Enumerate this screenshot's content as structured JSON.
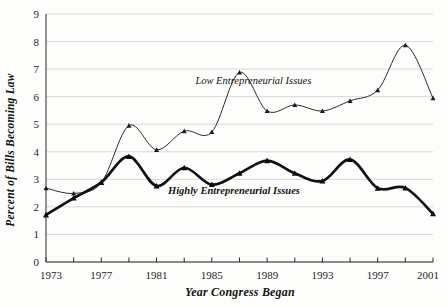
{
  "chart_data": {
    "type": "line",
    "title": "",
    "xlabel": "Year Congress Began",
    "ylabel": "Percent of Bills Becoming Law",
    "xlim": [
      1973,
      2001
    ],
    "ylim": [
      0,
      9
    ],
    "ytick_step": 1,
    "xtick_step": 4,
    "xminor_step": 2,
    "grid": "horizontal",
    "legend_position": "inline-annotation",
    "x": [
      1973,
      1975,
      1977,
      1979,
      1981,
      1983,
      1985,
      1987,
      1989,
      1991,
      1993,
      1995,
      1997,
      1999,
      2001
    ],
    "xticklabels": [
      "1973",
      "1977",
      "1981",
      "1985",
      "1989",
      "1993",
      "1997",
      "2001"
    ],
    "xtick_values": [
      1973,
      1977,
      1981,
      1985,
      1989,
      1993,
      1997,
      2001
    ],
    "yticklabels": [
      "0",
      "1",
      "2",
      "3",
      "4",
      "5",
      "6",
      "7",
      "8",
      "9"
    ],
    "ytick_values": [
      0,
      1,
      2,
      3,
      4,
      5,
      6,
      7,
      8,
      9
    ],
    "series": [
      {
        "name": "Low Entrepreneurial Issues",
        "style": "thin",
        "color": "#2b2b2b",
        "values": [
          2.68,
          2.49,
          2.88,
          4.95,
          4.07,
          4.75,
          4.72,
          6.88,
          5.48,
          5.7,
          5.48,
          5.85,
          6.24,
          7.87,
          5.95
        ],
        "label_x": 1988.0,
        "label_y": 6.45
      },
      {
        "name": "Highly Entrepreneurial Issues",
        "style": "thick",
        "color": "#111111",
        "values": [
          1.71,
          2.32,
          2.89,
          3.83,
          2.76,
          3.42,
          2.81,
          3.22,
          3.68,
          3.22,
          2.94,
          3.72,
          2.68,
          2.69,
          1.75
        ],
        "label_x": 1986.6,
        "label_y": 2.45
      }
    ],
    "annotations": [
      {
        "text": "Low Entrepreneurial Issues",
        "series": 0
      },
      {
        "text": "Highly Entrepreneurial Issues",
        "series": 1
      }
    ]
  }
}
